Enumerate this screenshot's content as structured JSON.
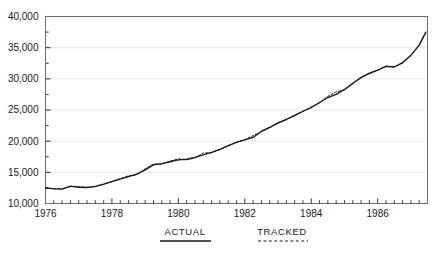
{
  "chart_data": {
    "type": "line",
    "title": "",
    "subtitle": "",
    "xlabel": "",
    "ylabel": "",
    "xlim": [
      1976.0,
      1987.5
    ],
    "ylim": [
      10000,
      40000
    ],
    "grid": true,
    "grid_axis": "y",
    "legend_position": "bottom",
    "y_ticks": [
      10000,
      15000,
      20000,
      25000,
      30000,
      35000,
      40000
    ],
    "y_tick_labels": [
      "10,000",
      "15,000",
      "20,000",
      "25,000",
      "30,000",
      "35,000",
      "40,000"
    ],
    "y_minor_tick_step": 2500,
    "x_ticks": [
      1976,
      1978,
      1980,
      1982,
      1984,
      1986
    ],
    "x_tick_labels": [
      "1976",
      "1978",
      "1980",
      "1982",
      "1984",
      "1986"
    ],
    "x_minor_tick_step": 0.25,
    "x": [
      1976.0,
      1976.25,
      1976.5,
      1976.75,
      1977.0,
      1977.25,
      1977.5,
      1977.75,
      1978.0,
      1978.25,
      1978.5,
      1978.75,
      1979.0,
      1979.25,
      1979.5,
      1979.75,
      1980.0,
      1980.25,
      1980.5,
      1980.75,
      1981.0,
      1981.25,
      1981.5,
      1981.75,
      1982.0,
      1982.25,
      1982.5,
      1982.75,
      1983.0,
      1983.25,
      1983.5,
      1983.75,
      1984.0,
      1984.25,
      1984.5,
      1984.75,
      1985.0,
      1985.25,
      1985.5,
      1985.75,
      1986.0,
      1986.25,
      1986.5,
      1986.75,
      1987.0,
      1987.25,
      1987.45
    ],
    "series": [
      {
        "name": "ACTUAL",
        "style": "solid",
        "color": "#1a1a1a",
        "values": [
          12500,
          12350,
          12300,
          12800,
          12600,
          12550,
          12750,
          13100,
          13500,
          13900,
          14300,
          14700,
          15400,
          16200,
          16400,
          16700,
          17000,
          17100,
          17400,
          17800,
          18200,
          18700,
          19300,
          19800,
          20200,
          20600,
          21600,
          22200,
          22900,
          23500,
          24100,
          24800,
          25400,
          26200,
          27000,
          27500,
          28300,
          29300,
          30200,
          30900,
          31400,
          32000,
          31900,
          32600,
          33800,
          35400,
          37500
        ]
      },
      {
        "name": "TRACKED",
        "style": "dashed",
        "color": "#1a1a1a",
        "values": [
          12480,
          12400,
          12360,
          12700,
          12700,
          12620,
          12700,
          13050,
          13550,
          13980,
          14450,
          14600,
          15550,
          16350,
          16300,
          16800,
          17150,
          17000,
          17300,
          18100,
          18150,
          18650,
          19250,
          19850,
          20250,
          20900,
          21500,
          22150,
          23000,
          23450,
          24200,
          24750,
          25500,
          26150,
          27200,
          27900,
          28200,
          29200,
          30300,
          30800,
          31350,
          32050,
          31950,
          32500,
          33750,
          35350,
          37450
        ]
      }
    ]
  },
  "legend": {
    "items": [
      {
        "label": "ACTUAL",
        "style": "solid"
      },
      {
        "label": "TRACKED",
        "style": "dashed"
      }
    ]
  }
}
